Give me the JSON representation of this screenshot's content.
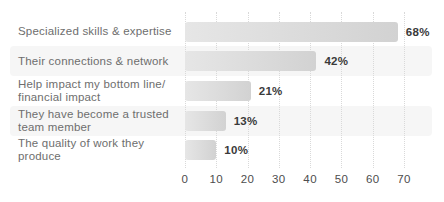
{
  "chart_data": {
    "type": "bar",
    "orientation": "horizontal",
    "categories": [
      "Specialized skills & expertise",
      "Their connections & network",
      "Help impact my bottom line/\nfinancial impact",
      "They have become a trusted\nteam member",
      "The quality of work they produce"
    ],
    "values": [
      68,
      42,
      21,
      13,
      10
    ],
    "value_labels": [
      "68%",
      "42%",
      "21%",
      "13%",
      "10%"
    ],
    "xticks": [
      "0",
      "10",
      "20",
      "30",
      "40",
      "50",
      "60",
      "70"
    ],
    "xlim": [
      0,
      70
    ],
    "xlabel": "",
    "ylabel": "",
    "legend": "none",
    "grid": "vertical dotted gridlines at each x tick",
    "striped_rows": [
      2,
      4
    ],
    "colors": {
      "background": "#ffffff",
      "bar_gradient_start": "#e6e6e6",
      "bar_gradient_end": "#d2d2d2",
      "row_stripe": "#f6f6f6",
      "gridline": "#d9d9d9",
      "category_label": "#6e6e6e",
      "value_label": "#3a3a3a",
      "axis_tick_label": "#4d4d4d"
    }
  }
}
